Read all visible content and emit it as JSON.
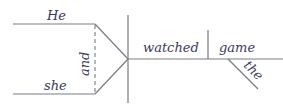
{
  "diagram": {
    "type": "sentence-diagram",
    "sentence": "He and she watched the game",
    "subjects": [
      {
        "word": "He"
      },
      {
        "word": "she"
      }
    ],
    "conjunction": "and",
    "verb": "watched",
    "object": "game",
    "modifier": "the",
    "colors": {
      "line": "#7a7a8a",
      "text": "#3a3a5c"
    }
  }
}
